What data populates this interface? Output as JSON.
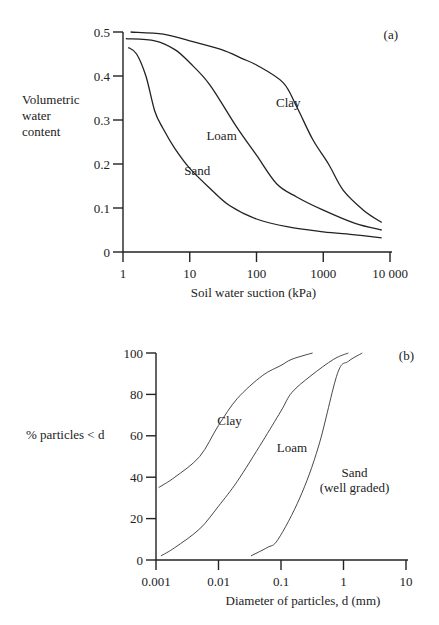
{
  "chart_data": [
    {
      "panel": "(a)",
      "type": "line",
      "title": "",
      "xlabel": "Soil water suction (kPa)",
      "ylabel": "Volumetric water content",
      "ylabel_lines": [
        "Volumetric",
        "water",
        "content"
      ],
      "xscale": "log",
      "xlim": [
        1,
        10000
      ],
      "ylim": [
        0,
        0.5
      ],
      "xticks": [
        1,
        10,
        100,
        1000,
        10000
      ],
      "xtick_labels": [
        "1",
        "10",
        "100",
        "1000",
        "10 000"
      ],
      "yticks": [
        0,
        0.1,
        0.2,
        0.3,
        0.4,
        0.5
      ],
      "ytick_labels": [
        "0",
        "0.1",
        "0.2",
        "0.3",
        "0.4",
        "0.5"
      ],
      "grid": false,
      "legend": "inline labels",
      "series": [
        {
          "name": "Sand",
          "x": [
            1.2,
            1.6,
            2.2,
            3,
            4,
            6,
            10,
            20,
            40,
            100,
            300,
            1000,
            3000,
            7500
          ],
          "y": [
            0.465,
            0.45,
            0.4,
            0.32,
            0.28,
            0.235,
            0.19,
            0.145,
            0.105,
            0.075,
            0.057,
            0.046,
            0.039,
            0.032
          ]
        },
        {
          "name": "Loam",
          "x": [
            1.1,
            3,
            6,
            10,
            20,
            50,
            100,
            200,
            400,
            1000,
            3000,
            7500
          ],
          "y": [
            0.485,
            0.48,
            0.46,
            0.43,
            0.38,
            0.285,
            0.22,
            0.155,
            0.125,
            0.095,
            0.065,
            0.05
          ]
        },
        {
          "name": "Clay",
          "x": [
            1.3,
            4,
            10,
            30,
            60,
            100,
            250,
            400,
            700,
            1200,
            2000,
            4000,
            7500
          ],
          "y": [
            0.5,
            0.495,
            0.48,
            0.46,
            0.44,
            0.425,
            0.385,
            0.33,
            0.255,
            0.2,
            0.14,
            0.095,
            0.067
          ]
        }
      ],
      "annotations": [
        {
          "text": "Clay",
          "x": 300,
          "y": 0.33
        },
        {
          "text": "Loam",
          "x": 30,
          "y": 0.255
        },
        {
          "text": "Sand",
          "x": 13,
          "y": 0.175
        },
        {
          "text": "(a)",
          "position": "top-right"
        }
      ]
    },
    {
      "panel": "(b)",
      "type": "line",
      "title": "",
      "xlabel": "Diameter of particles, d (mm)",
      "ylabel": "% particles < d",
      "xscale": "log",
      "xlim": [
        0.001,
        10
      ],
      "ylim": [
        0,
        100
      ],
      "xticks": [
        0.001,
        0.01,
        0.1,
        1,
        10
      ],
      "xtick_labels": [
        "0.001",
        "0.01",
        "0.1",
        "1",
        "10"
      ],
      "yticks": [
        0,
        20,
        40,
        60,
        80,
        100
      ],
      "ytick_labels": [
        "0",
        "20",
        "40",
        "60",
        "80",
        "100"
      ],
      "grid": false,
      "legend": "inline labels",
      "series": [
        {
          "name": "Clay",
          "x": [
            0.0011,
            0.002,
            0.005,
            0.01,
            0.02,
            0.05,
            0.1,
            0.15,
            0.32
          ],
          "y": [
            35,
            40,
            50,
            65,
            78,
            89,
            94,
            97,
            100
          ]
        },
        {
          "name": "Loam",
          "x": [
            0.0012,
            0.002,
            0.005,
            0.01,
            0.02,
            0.05,
            0.1,
            0.15,
            0.3,
            0.7,
            1.2
          ],
          "y": [
            2,
            6,
            15,
            26,
            38,
            57,
            72,
            81,
            89,
            97,
            100
          ]
        },
        {
          "name": "Sand (well graded)",
          "x": [
            0.033,
            0.06,
            0.09,
            0.2,
            0.4,
            0.8,
            1.2,
            2
          ],
          "y": [
            2,
            6,
            10,
            30,
            55,
            90,
            96,
            100
          ]
        }
      ],
      "annotations": [
        {
          "text": "Clay",
          "x": 0.015,
          "y": 65
        },
        {
          "text": "Loam",
          "x": 0.15,
          "y": 52
        },
        {
          "text": "Sand",
          "x": 1.5,
          "y": 40
        },
        {
          "text": "(well graded)",
          "x": 1.5,
          "y": 33
        },
        {
          "text": "(b)",
          "position": "top-right"
        }
      ]
    }
  ]
}
